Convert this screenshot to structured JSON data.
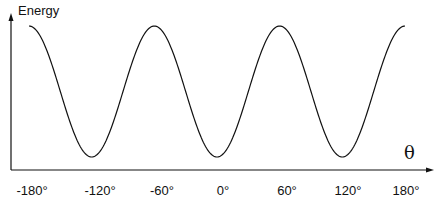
{
  "chart_data": {
    "type": "line",
    "title": "",
    "xlabel": "θ",
    "ylabel": "Energy",
    "x_ticks": [
      "-180°",
      "-120°",
      "-60°",
      "0°",
      "60°",
      "120°",
      "180°"
    ],
    "x_range": [
      -180,
      180
    ],
    "y_ticks": [],
    "grid": false,
    "legend": null,
    "series": [
      {
        "name": "Energy",
        "function": "E(θ) ∝ -cos(3θ) (relative, unitless)",
        "x": [
          -180,
          -150,
          -120,
          -90,
          -60,
          -30,
          0,
          30,
          60,
          90,
          120,
          150,
          180
        ],
        "values": [
          1,
          0,
          -1,
          0,
          1,
          0,
          -1,
          0,
          1,
          0,
          -1,
          0,
          1
        ]
      }
    ],
    "maxima_at": [
      -180,
      -60,
      60,
      180
    ],
    "minima_at": [
      -120,
      0,
      120
    ]
  },
  "labels": {
    "ylabel": "Energy",
    "xsymbol": "θ",
    "ticks": [
      "-180°",
      "-120°",
      "-60°",
      "0°",
      "60°",
      "120°",
      "180°"
    ]
  },
  "colors": {
    "line": "#111111",
    "axis": "#111111",
    "background": "#ffffff"
  }
}
